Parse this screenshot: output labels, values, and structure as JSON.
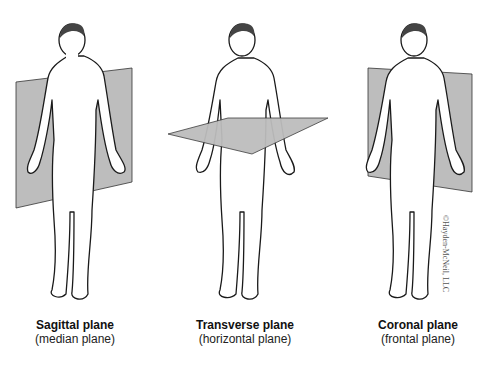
{
  "diagram": {
    "plane_color": "#b9b9b9",
    "outline_color": "#1a1a1a",
    "panels": [
      {
        "id": "sagittal",
        "title": "Sagittal plane",
        "subtitle": "(median plane)"
      },
      {
        "id": "transverse",
        "title": "Transverse plane",
        "subtitle": "(horizontal plane)"
      },
      {
        "id": "coronal",
        "title": "Coronal plane",
        "subtitle": "(frontal plane)"
      }
    ],
    "copyright": "©Hayden-McNeil, LLC"
  }
}
